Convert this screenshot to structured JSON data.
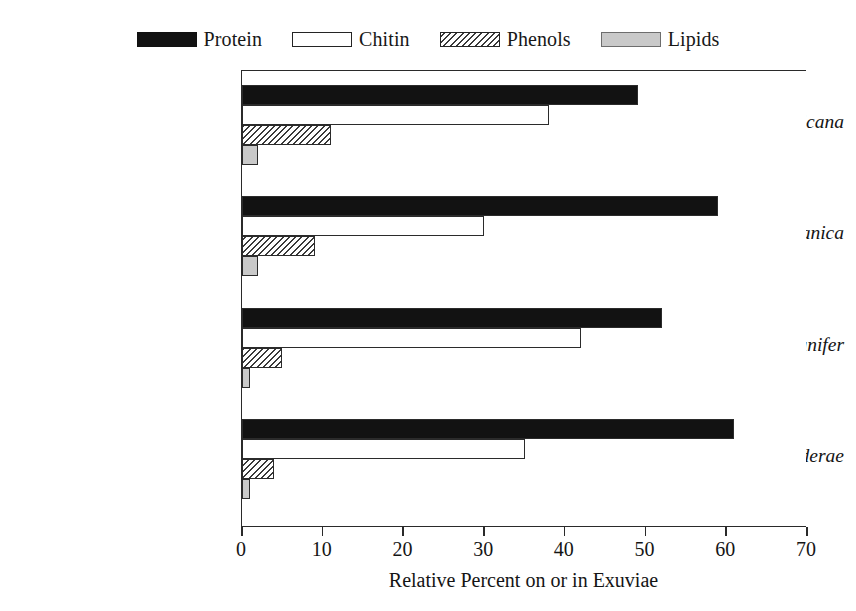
{
  "chart_data": {
    "type": "bar",
    "orientation": "horizontal",
    "title": "",
    "xlabel": "Relative Percent on or in Exuviae",
    "ylabel": "",
    "xlim": [
      0,
      70
    ],
    "xticks": [
      0,
      10,
      20,
      30,
      40,
      50,
      60,
      70
    ],
    "grid": false,
    "legend_position": "top-center",
    "categories": [
      "Periplaneta americana",
      "Blatella germanica",
      "Blaberus cranifer",
      "Leucophaea maderae"
    ],
    "series": [
      {
        "name": "Protein",
        "values": [
          49,
          59,
          52,
          61
        ],
        "fill": "solid-black",
        "color": "#121212"
      },
      {
        "name": "Chitin",
        "values": [
          38,
          30,
          42,
          35
        ],
        "fill": "white-outline",
        "color": "#ffffff"
      },
      {
        "name": "Phenols",
        "values": [
          11,
          9,
          5,
          4
        ],
        "fill": "diagonal-hatch",
        "color": "#3a3a3a"
      },
      {
        "name": "Lipids",
        "values": [
          2,
          2,
          1,
          1
        ],
        "fill": "light-gray",
        "color": "#c9c9c9"
      }
    ]
  },
  "legend": {
    "items": [
      {
        "label": "Protein",
        "swatch": "protein-swatch"
      },
      {
        "label": "Chitin",
        "swatch": "chitin-swatch"
      },
      {
        "label": "Phenols",
        "swatch": "phenols-swatch"
      },
      {
        "label": "Lipids",
        "swatch": "lipids-swatch"
      }
    ]
  },
  "axis": {
    "x_title": "Relative Percent on or in Exuviae",
    "x_tick_labels": [
      "0",
      "10",
      "20",
      "30",
      "40",
      "50",
      "60",
      "70"
    ]
  }
}
